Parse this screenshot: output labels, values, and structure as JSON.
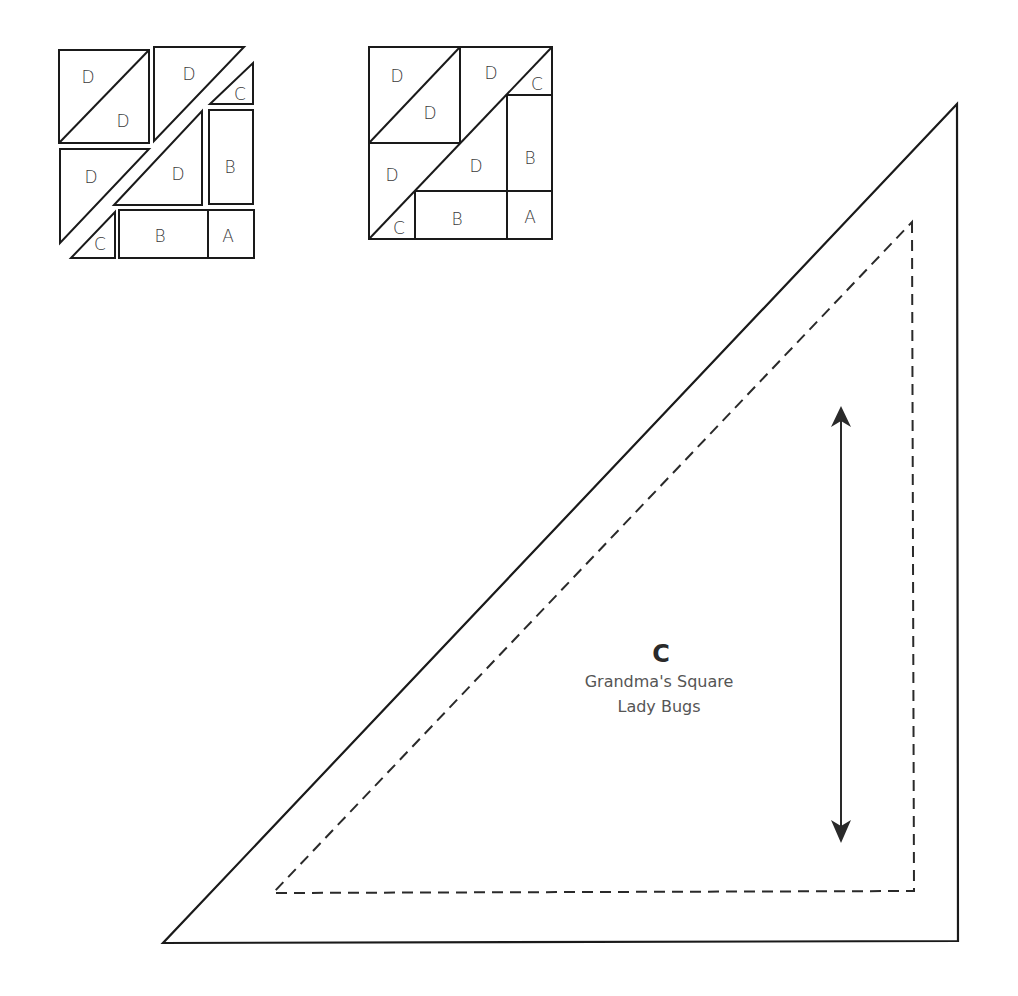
{
  "exploded_block": {
    "pieces": [
      {
        "label": "D",
        "x": 88,
        "y": 83
      },
      {
        "label": "D",
        "x": 123,
        "y": 127
      },
      {
        "label": "D",
        "x": 189,
        "y": 80
      },
      {
        "label": "C",
        "x": 240,
        "y": 100
      },
      {
        "label": "B",
        "x": 230,
        "y": 173
      },
      {
        "label": "D",
        "x": 91,
        "y": 183
      },
      {
        "label": "D",
        "x": 178,
        "y": 180
      },
      {
        "label": "C",
        "x": 100,
        "y": 250
      },
      {
        "label": "B",
        "x": 160,
        "y": 242
      },
      {
        "label": "A",
        "x": 228,
        "y": 242
      }
    ]
  },
  "assembled_block": {
    "pieces": [
      {
        "label": "D",
        "x": 397,
        "y": 82
      },
      {
        "label": "D",
        "x": 430,
        "y": 119
      },
      {
        "label": "D",
        "x": 491,
        "y": 79
      },
      {
        "label": "C",
        "x": 537,
        "y": 90
      },
      {
        "label": "B",
        "x": 530,
        "y": 164
      },
      {
        "label": "D",
        "x": 392,
        "y": 181
      },
      {
        "label": "D",
        "x": 476,
        "y": 172
      },
      {
        "label": "C",
        "x": 399,
        "y": 234
      },
      {
        "label": "B",
        "x": 457,
        "y": 225
      },
      {
        "label": "A",
        "x": 530,
        "y": 223
      }
    ]
  },
  "template": {
    "piece_letter": "C",
    "pattern_name": "Grandma's Square",
    "block_name": "Lady Bugs",
    "grain_arrow": "vertical double-headed arrow"
  }
}
